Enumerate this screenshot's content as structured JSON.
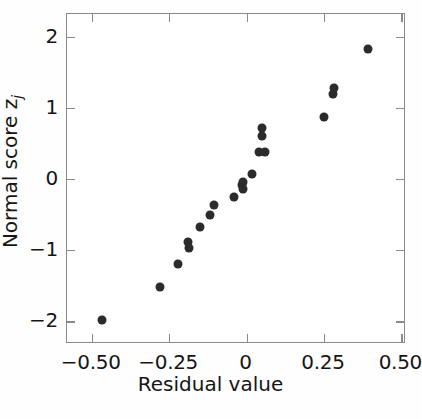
{
  "chart_data": {
    "type": "scatter",
    "title": "",
    "xlabel": "Residual value",
    "ylabel": "Normal score z",
    "ylabel_subscript": "j",
    "xlim": [
      -0.58,
      0.515
    ],
    "ylim": [
      -2.32,
      2.32
    ],
    "xticks": [
      -0.5,
      -0.25,
      0,
      0.25,
      0.5
    ],
    "xticklabels": [
      "−0.50",
      "−0.25",
      "0",
      "0.25",
      "0.50"
    ],
    "yticks": [
      2,
      1,
      0,
      -1,
      -2
    ],
    "yticklabels": [
      "2",
      "1",
      "0",
      "−1",
      "−2"
    ],
    "grid": false,
    "legend": null,
    "marker": "filled-circle",
    "marker_color": "#2b2b2b",
    "frame_color": "#8a8a8a",
    "n_points": 20,
    "points": [
      {
        "x": -0.468,
        "y": -1.98
      },
      {
        "x": -0.278,
        "y": -1.52
      },
      {
        "x": -0.222,
        "y": -1.2
      },
      {
        "x": -0.19,
        "y": -0.88
      },
      {
        "x": -0.186,
        "y": -0.97
      },
      {
        "x": -0.149,
        "y": -0.67
      },
      {
        "x": -0.118,
        "y": -0.51
      },
      {
        "x": -0.105,
        "y": -0.36
      },
      {
        "x": -0.041,
        "y": -0.25
      },
      {
        "x": -0.016,
        "y": -0.09
      },
      {
        "x": -0.013,
        "y": -0.04
      },
      {
        "x": -0.01,
        "y": -0.14
      },
      {
        "x": 0.019,
        "y": 0.07
      },
      {
        "x": 0.041,
        "y": 0.38
      },
      {
        "x": 0.06,
        "y": 0.38
      },
      {
        "x": 0.051,
        "y": 0.6
      },
      {
        "x": 0.051,
        "y": 0.72
      },
      {
        "x": 0.25,
        "y": 0.87
      },
      {
        "x": 0.279,
        "y": 1.19
      },
      {
        "x": 0.282,
        "y": 1.28
      },
      {
        "x": 0.392,
        "y": 1.83
      }
    ]
  },
  "caption": {
    "text": ""
  }
}
